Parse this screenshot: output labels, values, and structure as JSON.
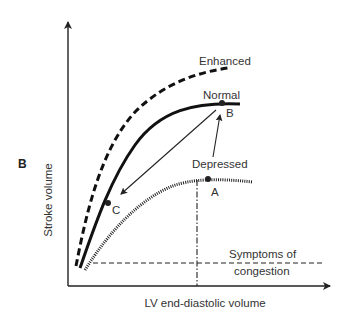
{
  "figure": {
    "panel_label": "B",
    "y_axis_label": "Stroke volume",
    "x_axis_label": "LV end-diastolic volume",
    "curves": {
      "enhanced": {
        "label": "Enhanced",
        "style": "dashed"
      },
      "normal": {
        "label": "Normal",
        "style": "solid"
      },
      "depressed": {
        "label": "Depressed",
        "style": "dotted"
      }
    },
    "points": {
      "a": "A",
      "b": "B",
      "c": "C"
    },
    "threshold": {
      "label_line1": "Symptoms of",
      "label_line2": "congestion"
    },
    "colors": {
      "line": "#111111",
      "text": "#333333",
      "background": "#ffffff"
    }
  }
}
